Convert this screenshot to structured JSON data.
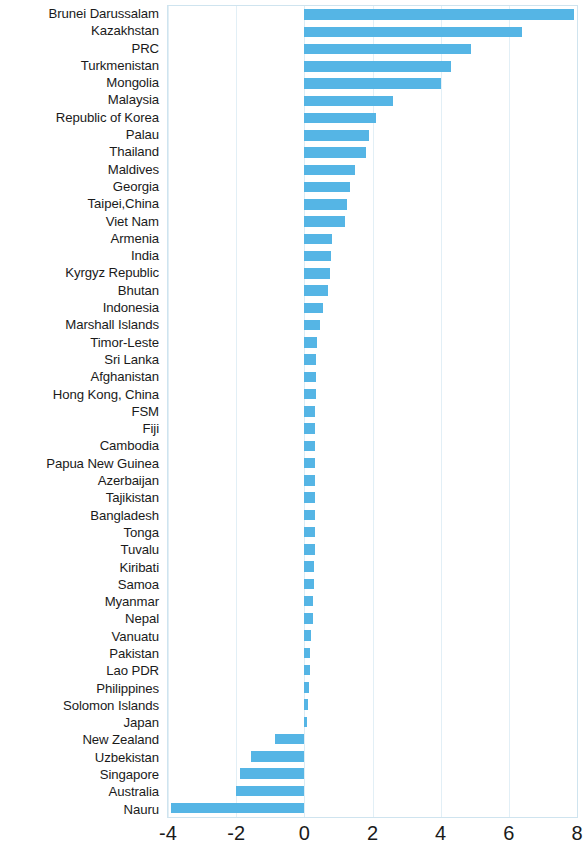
{
  "chart": {
    "type": "barh",
    "title": "",
    "subtitle": "",
    "xlabel": "",
    "ylabel": "",
    "xlim": [
      -4,
      8
    ],
    "xticks": [
      "-4",
      "-2",
      "0",
      "2",
      "4",
      "6",
      "8"
    ],
    "xtick_values": [
      -4,
      -2,
      0,
      2,
      4,
      6,
      8
    ],
    "grid": "vertical",
    "legend": "none",
    "bar_color": "#55b5e5",
    "grid_color": "#e2eff6",
    "border_color": "#cfe4ef"
  },
  "chart_data": {
    "type": "bar",
    "orientation": "horizontal",
    "title": "",
    "xlabel": "",
    "ylabel": "",
    "xlim": [
      -4,
      8
    ],
    "grid": true,
    "legend_position": "none",
    "categories": [
      "Brunei Darussalam",
      "Kazakhstan",
      "PRC",
      "Turkmenistan",
      "Mongolia",
      "Malaysia",
      "Republic of Korea",
      "Palau",
      "Thailand",
      "Maldives",
      "Georgia",
      "Taipei,China",
      "Viet Nam",
      "Armenia",
      "India",
      "Kyrgyz Republic",
      "Bhutan",
      "Indonesia",
      "Marshall Islands",
      "Timor-Leste",
      "Sri Lanka",
      "Afghanistan",
      "Hong Kong, China",
      "FSM",
      "Fiji",
      "Cambodia",
      "Papua New Guinea",
      "Azerbaijan",
      "Tajikistan",
      "Bangladesh",
      "Tonga",
      "Tuvalu",
      "Kiribati",
      "Samoa",
      "Myanmar",
      "Nepal",
      "Vanuatu",
      "Pakistan",
      "Lao PDR",
      "Philippines",
      "Solomon Islands",
      "Japan",
      "New Zealand",
      "Uzbekistan",
      "Singapore",
      "Australia",
      "Nauru"
    ],
    "values": [
      7.9,
      6.4,
      4.9,
      4.3,
      4.0,
      2.6,
      2.1,
      1.9,
      1.8,
      1.5,
      1.35,
      1.25,
      1.2,
      0.8,
      0.78,
      0.75,
      0.7,
      0.55,
      0.45,
      0.38,
      0.35,
      0.34,
      0.33,
      0.32,
      0.32,
      0.32,
      0.31,
      0.31,
      0.3,
      0.3,
      0.3,
      0.3,
      0.28,
      0.27,
      0.25,
      0.24,
      0.2,
      0.18,
      0.16,
      0.13,
      0.1,
      0.07,
      -0.87,
      -1.57,
      -1.9,
      -2.0,
      -3.9
    ]
  }
}
